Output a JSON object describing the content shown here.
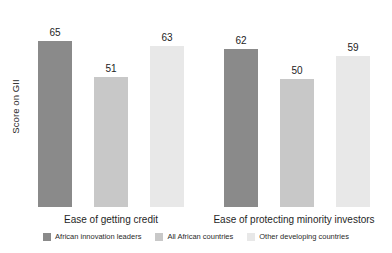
{
  "chart_data": {
    "type": "bar",
    "title": "",
    "subtitle": "",
    "xlabel": "",
    "ylabel": "Score on GII",
    "ylim": [
      0,
      72
    ],
    "grid": false,
    "legend_position": "bottom",
    "value_labels": true,
    "categories": [
      "Ease of getting credit",
      "Ease of protecting minority investors"
    ],
    "series": [
      {
        "name": "African innovation leaders",
        "color": "#8a8a8a",
        "values": [
          65,
          62
        ]
      },
      {
        "name": "All African countries",
        "color": "#c8c8c8",
        "values": [
          51,
          50
        ]
      },
      {
        "name": "Other developing countries",
        "color": "#e8e8e8",
        "values": [
          63,
          59
        ]
      }
    ]
  },
  "axis": {
    "y_title": "Score on GII"
  },
  "groups": [
    {
      "label": "Ease of getting credit",
      "bars": [
        {
          "series": "African innovation leaders",
          "value": 65,
          "value_text": "65",
          "color": "#8a8a8a"
        },
        {
          "series": "All African countries",
          "value": 51,
          "value_text": "51",
          "color": "#c8c8c8"
        },
        {
          "series": "Other developing countries",
          "value": 63,
          "value_text": "63",
          "color": "#e8e8e8"
        }
      ]
    },
    {
      "label": "Ease of protecting minority investors",
      "bars": [
        {
          "series": "African innovation leaders",
          "value": 62,
          "value_text": "62",
          "color": "#8a8a8a"
        },
        {
          "series": "All African countries",
          "value": 50,
          "value_text": "50",
          "color": "#c8c8c8"
        },
        {
          "series": "Other developing countries",
          "value": 59,
          "value_text": "59",
          "color": "#e8e8e8"
        }
      ]
    }
  ],
  "legend": [
    {
      "label": "African innovation leaders",
      "color": "#8a8a8a"
    },
    {
      "label": "All African countries",
      "color": "#c8c8c8"
    },
    {
      "label": "Other developing countries",
      "color": "#e8e8e8"
    }
  ]
}
